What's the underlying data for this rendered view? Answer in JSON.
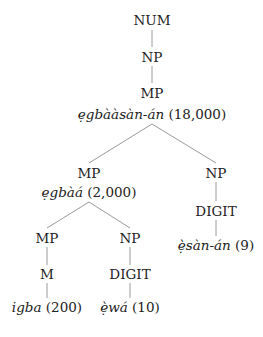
{
  "tree": {
    "root": {
      "label": "NUM"
    },
    "np1": {
      "label": "NP"
    },
    "mp1": {
      "label": "MP",
      "word": "ẹgbààsàn-án",
      "gloss": "(18,000)"
    },
    "mp2": {
      "label": "MP",
      "word": "ẹgbàá",
      "gloss": "(2,000)"
    },
    "np2": {
      "label": "NP"
    },
    "digit2": {
      "label": "DIGIT",
      "word": "ẹ̀sàn-án",
      "gloss": "(9)"
    },
    "mp3": {
      "label": "MP"
    },
    "m3": {
      "label": "M",
      "word": "igba",
      "gloss": "(200)"
    },
    "np3": {
      "label": "NP"
    },
    "digit3": {
      "label": "DIGIT",
      "word": "ẹ̀wá",
      "gloss": "(10)"
    }
  },
  "colors": {
    "line": "#9a9a9a",
    "text": "#222222"
  }
}
